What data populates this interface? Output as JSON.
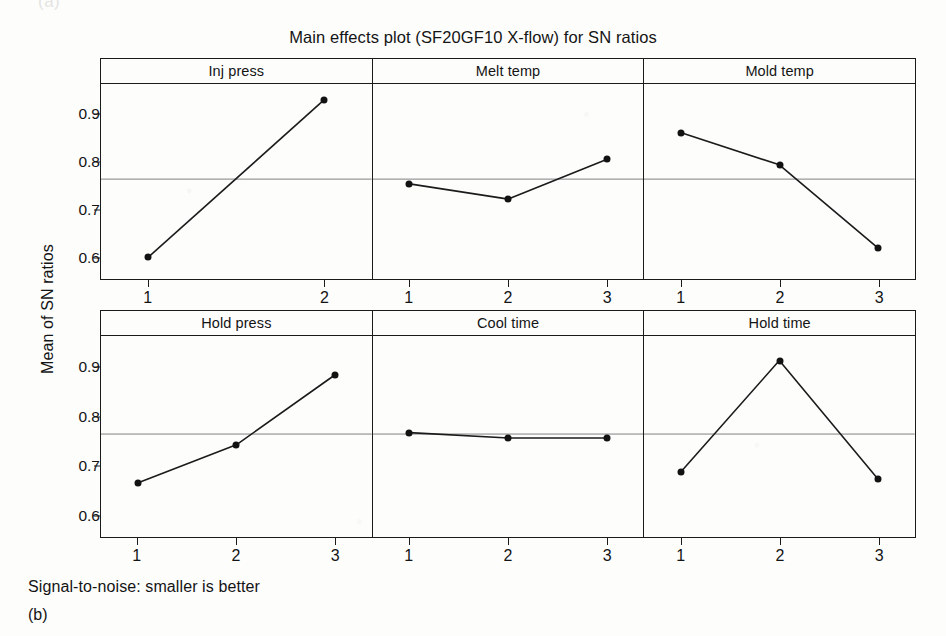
{
  "top_artifact": "(a)",
  "footer": {
    "note": "Signal-to-noise: smaller is better",
    "caption": "(b)"
  },
  "chart_data": {
    "type": "line",
    "title": "Main effects plot (SF20GF10 X-flow) for SN ratios",
    "xlabel": "",
    "ylabel": "Mean of SN ratios",
    "ylim": [
      0.555,
      0.965
    ],
    "yticks": [
      0.9,
      0.8,
      0.7,
      0.6
    ],
    "ytick_labels": [
      "0.9",
      "0.8",
      "0.7",
      "0.6"
    ],
    "grid": false,
    "reference_line": 0.765,
    "legend": "none",
    "layout": {
      "rows": 2,
      "cols": 3
    },
    "panels": [
      {
        "name": "Inj press",
        "categories": [
          "1",
          "2"
        ],
        "values": [
          0.601,
          0.932
        ]
      },
      {
        "name": "Melt temp",
        "categories": [
          "1",
          "2",
          "3"
        ],
        "values": [
          0.755,
          0.723,
          0.807
        ]
      },
      {
        "name": "Mold temp",
        "categories": [
          "1",
          "2",
          "3"
        ],
        "values": [
          0.863,
          0.795,
          0.62
        ]
      },
      {
        "name": "Hold press",
        "categories": [
          "1",
          "2",
          "3"
        ],
        "values": [
          0.665,
          0.743,
          0.886
        ]
      },
      {
        "name": "Cool time",
        "categories": [
          "1",
          "2",
          "3"
        ],
        "values": [
          0.768,
          0.757,
          0.757
        ]
      },
      {
        "name": "Hold time",
        "categories": [
          "1",
          "2",
          "3"
        ],
        "values": [
          0.687,
          0.915,
          0.673
        ]
      }
    ]
  }
}
